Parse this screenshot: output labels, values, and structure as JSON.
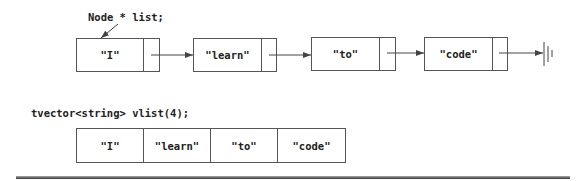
{
  "linked_list": {
    "declaration": "Node * list;",
    "nodes": [
      {
        "value": "\"I\""
      },
      {
        "value": "\"learn\""
      },
      {
        "value": "\"to\""
      },
      {
        "value": "\"code\""
      }
    ],
    "terminator": "null-ground-icon"
  },
  "vector": {
    "declaration": "tvector<string> vlist(4);",
    "cells": [
      "\"I\"",
      "\"learn\"",
      "\"to\"",
      "\"code\""
    ]
  },
  "colors": {
    "line": "#555555",
    "text": "#222222"
  }
}
